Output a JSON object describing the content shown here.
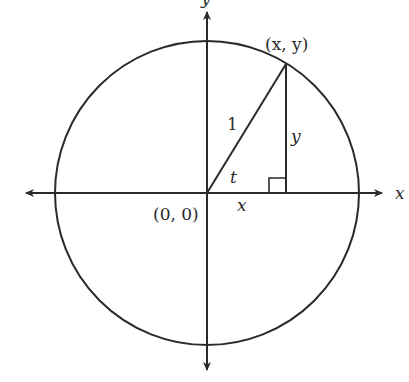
{
  "diagram": {
    "type": "unit-circle",
    "labels": {
      "point": "(x, y)",
      "origin": "(0, 0)",
      "hypotenuse": "1",
      "angle": "t",
      "vertical_leg": "y",
      "horizontal_leg": "x",
      "x_axis": "x",
      "y_axis": "y"
    },
    "colors": {
      "stroke": "#2a2a2a",
      "background": "#ffffff"
    }
  }
}
